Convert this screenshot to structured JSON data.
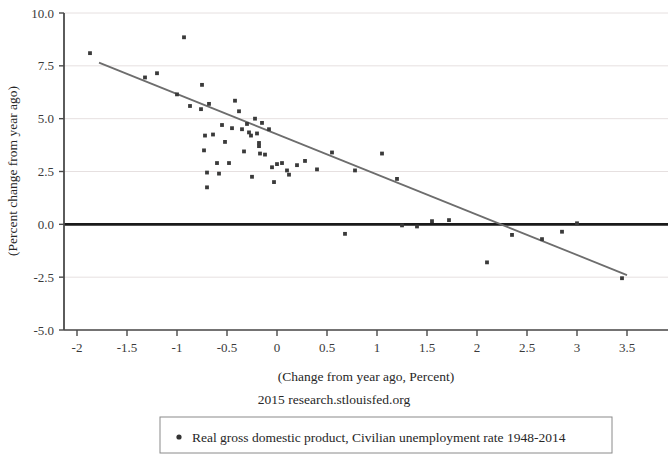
{
  "chart_data": {
    "type": "scatter",
    "title": "",
    "subtitle": "",
    "xlabel": "(Change from year ago, Percent)",
    "ylabel": "(Percent change from year ago)",
    "xlim": [
      -2.25,
      3.5
    ],
    "ylim": [
      -5.0,
      10.0
    ],
    "xticks": [
      "-2",
      "-1.5",
      "-1",
      "-0.5",
      "0",
      "0.5",
      "1",
      "1.5",
      "2",
      "2.5",
      "3",
      "3.5"
    ],
    "xtick_values": [
      -2,
      -1.5,
      -1,
      -0.5,
      0,
      0.5,
      1,
      1.5,
      2,
      2.5,
      3,
      3.5
    ],
    "yticks": [
      "10.0",
      "7.5",
      "5.0",
      "2.5",
      "0.0",
      "-2.5",
      "-5.0"
    ],
    "ytick_values": [
      10.0,
      7.5,
      5.0,
      2.5,
      0.0,
      -2.5,
      -5.0
    ],
    "grid": true,
    "grid_axis": "y",
    "zero_line": 0.0,
    "legend_position": "bottom",
    "legend": [
      {
        "marker": "dot",
        "color": "#333333",
        "label": "Real gross domestic product, Civilian unemployment rate 1948-2014"
      }
    ],
    "source": "2015 research.stlouisfed.org",
    "series": [
      {
        "name": "Real gross domestic product, Civilian unemployment rate 1948-2014",
        "marker_color": "#3a3a3a",
        "points": [
          [
            -2.25,
            7.3
          ],
          [
            -1.87,
            8.1
          ],
          [
            -1.32,
            6.95
          ],
          [
            -1.2,
            7.15
          ],
          [
            -1.0,
            6.15
          ],
          [
            -0.93,
            8.85
          ],
          [
            -0.87,
            5.6
          ],
          [
            -0.75,
            6.6
          ],
          [
            -0.76,
            5.45
          ],
          [
            -0.72,
            4.2
          ],
          [
            -0.73,
            3.5
          ],
          [
            -0.7,
            2.45
          ],
          [
            -0.7,
            1.75
          ],
          [
            -0.68,
            5.7
          ],
          [
            -0.64,
            4.25
          ],
          [
            -0.6,
            2.9
          ],
          [
            -0.58,
            2.4
          ],
          [
            -0.55,
            4.7
          ],
          [
            -0.52,
            3.9
          ],
          [
            -0.48,
            2.9
          ],
          [
            -0.45,
            4.55
          ],
          [
            -0.42,
            5.85
          ],
          [
            -0.38,
            5.35
          ],
          [
            -0.35,
            4.5
          ],
          [
            -0.33,
            3.45
          ],
          [
            -0.3,
            4.75
          ],
          [
            -0.28,
            4.35
          ],
          [
            -0.26,
            4.2
          ],
          [
            -0.25,
            2.25
          ],
          [
            -0.22,
            5.0
          ],
          [
            -0.2,
            4.3
          ],
          [
            -0.18,
            3.85
          ],
          [
            -0.18,
            3.7
          ],
          [
            -0.17,
            3.35
          ],
          [
            -0.15,
            4.8
          ],
          [
            -0.12,
            3.3
          ],
          [
            -0.08,
            4.5
          ],
          [
            -0.05,
            2.7
          ],
          [
            -0.03,
            2.0
          ],
          [
            0.0,
            2.85
          ],
          [
            0.05,
            2.9
          ],
          [
            0.1,
            2.55
          ],
          [
            0.12,
            2.35
          ],
          [
            0.2,
            2.8
          ],
          [
            0.28,
            3.0
          ],
          [
            0.4,
            2.6
          ],
          [
            0.55,
            3.4
          ],
          [
            0.68,
            -0.45
          ],
          [
            0.78,
            2.55
          ],
          [
            1.05,
            3.35
          ],
          [
            1.2,
            2.15
          ],
          [
            1.25,
            -0.05
          ],
          [
            1.4,
            -0.1
          ],
          [
            1.55,
            0.15
          ],
          [
            1.72,
            0.2
          ],
          [
            2.1,
            -1.8
          ],
          [
            2.35,
            -0.5
          ],
          [
            2.65,
            -0.7
          ],
          [
            2.85,
            -0.35
          ],
          [
            3.0,
            0.05
          ],
          [
            3.45,
            -2.55
          ]
        ]
      }
    ],
    "trendline": {
      "type": "linear",
      "color": "#6d6d6d",
      "start": [
        -1.78,
        7.65
      ],
      "end": [
        3.5,
        -2.4
      ],
      "x_intercept": 2.0
    }
  }
}
